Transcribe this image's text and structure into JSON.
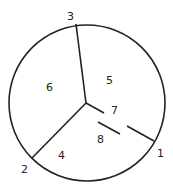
{
  "diagram": {
    "type": "circle-partition",
    "circle": {
      "cx": 87,
      "cy": 103,
      "r": 78
    },
    "center": {
      "x": 86,
      "y": 103
    },
    "boundary_points": [
      {
        "id": "1",
        "label": "1",
        "x": 154,
        "y": 141,
        "label_x": 157,
        "label_y": 157
      },
      {
        "id": "2",
        "label": "2",
        "x": 32,
        "y": 158,
        "label_x": 21,
        "label_y": 173
      },
      {
        "id": "3",
        "label": "3",
        "x": 76,
        "y": 24,
        "label_x": 67,
        "label_y": 20
      }
    ],
    "regions": [
      {
        "label": "4",
        "x": 58,
        "y": 159
      },
      {
        "label": "5",
        "x": 106,
        "y": 84
      },
      {
        "label": "6",
        "x": 46,
        "y": 91
      },
      {
        "label": "7",
        "x": 111,
        "y": 114
      },
      {
        "label": "8",
        "x": 97,
        "y": 143
      }
    ],
    "segments": [
      {
        "name": "spoke-to-3",
        "x1": 86,
        "y1": 103,
        "x2": 76,
        "y2": 24
      },
      {
        "name": "spoke-to-2",
        "x1": 86,
        "y1": 103,
        "x2": 32,
        "y2": 158
      },
      {
        "name": "spoke-to-7",
        "x1": 86,
        "y1": 103,
        "x2": 104,
        "y2": 113
      },
      {
        "name": "dash-inner",
        "x1": 98,
        "y1": 122,
        "x2": 120,
        "y2": 134
      },
      {
        "name": "dash-outer",
        "x1": 127,
        "y1": 126,
        "x2": 154,
        "y2": 141
      }
    ]
  }
}
